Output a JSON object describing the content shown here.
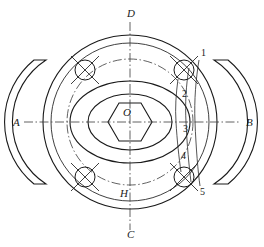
{
  "drawing": {
    "title": "Flanged valve body plan view",
    "type": "engineering-drawing",
    "background_color": "#ffffff",
    "line_color": "#1a1a1a",
    "center": {
      "x": 130,
      "y": 122
    },
    "axis_labels": [
      {
        "id": "A",
        "text": "A",
        "x": 13,
        "y": 126,
        "position": "left"
      },
      {
        "id": "B",
        "text": "B",
        "x": 246,
        "y": 126,
        "position": "right"
      },
      {
        "id": "C",
        "text": "C",
        "x": 127,
        "y": 236,
        "position": "bottom"
      },
      {
        "id": "D",
        "text": "D",
        "x": 127,
        "y": 17,
        "position": "top"
      },
      {
        "id": "H",
        "text": "H",
        "x": 121,
        "y": 195,
        "position": "inner-bottom"
      },
      {
        "id": "O",
        "text": "O",
        "x": 124,
        "y": 114,
        "position": "center"
      }
    ],
    "callouts": [
      {
        "id": "1",
        "text": "1",
        "x": 201,
        "y": 55
      },
      {
        "id": "2",
        "text": "2",
        "x": 183,
        "y": 96
      },
      {
        "id": "3",
        "text": "3",
        "x": 184,
        "y": 131
      },
      {
        "id": "4",
        "text": "4",
        "x": 182,
        "y": 158
      },
      {
        "id": "5",
        "text": "5",
        "x": 200,
        "y": 192
      }
    ],
    "circles": {
      "outer_radius": 87,
      "second_radius": 79,
      "bolt_circle_radius": 63,
      "ellipse_outer": {
        "rx": 60,
        "ry": 41
      },
      "ellipse_inner": {
        "rx": 42,
        "ry": 28
      },
      "hexagon_radius": 22,
      "bolt_hole_radius": 10
    },
    "bolt_holes": [
      {
        "id": "bolt-hole-top-left",
        "x": 85,
        "y": 70
      },
      {
        "id": "bolt-hole-top-right",
        "x": 184,
        "y": 70
      },
      {
        "id": "bolt-hole-bottom-left",
        "x": 85,
        "y": 177
      },
      {
        "id": "bolt-hole-bottom-right",
        "x": 184,
        "y": 177
      }
    ],
    "flanges": [
      {
        "id": "flange-left",
        "side": "left"
      },
      {
        "id": "flange-right",
        "side": "right"
      }
    ]
  }
}
